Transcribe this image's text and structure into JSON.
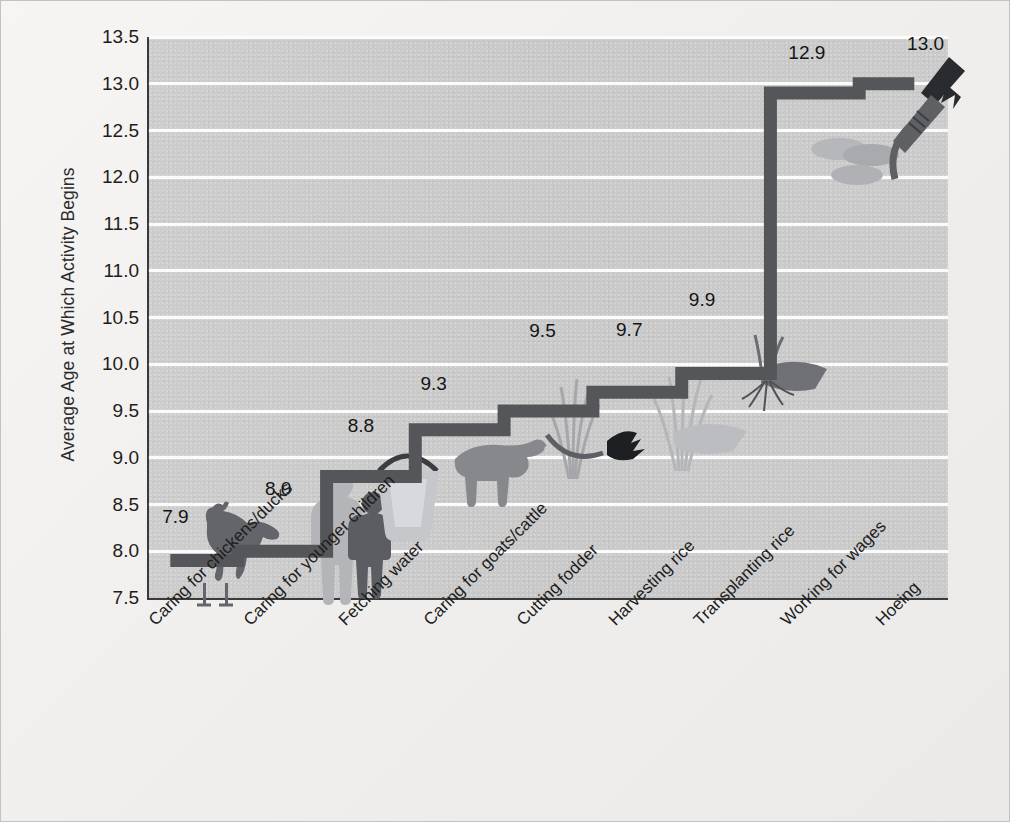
{
  "chart_data": {
    "type": "line",
    "title": "",
    "xlabel": "",
    "ylabel": "Average Age at Which Activity Begins",
    "categories": [
      "Caring for chickens/ducks",
      "Caring for younger children",
      "Fetching water",
      "Caring for goats/cattle",
      "Cutting fodder",
      "Harvesting  rice",
      "Transplanting rice",
      "Working for wages",
      "Hoeing"
    ],
    "values": [
      7.9,
      8.0,
      8.8,
      9.3,
      9.5,
      9.7,
      9.9,
      12.9,
      13.0
    ],
    "value_labels": [
      "7.9",
      "8.0",
      "8.8",
      "9.3",
      "9.5",
      "9.7",
      "9.9",
      "12.9",
      "13.0"
    ],
    "ylim": [
      7.5,
      13.5
    ],
    "ytick_labels": [
      "13.5",
      "13.0",
      "12.5",
      "12.0",
      "11.5",
      "11.0",
      "10.5",
      "10.0",
      "9.5",
      "9.0",
      "8.5",
      "8.0",
      "7.5"
    ],
    "ytick_values": [
      13.5,
      13.0,
      12.5,
      12.0,
      11.5,
      11.0,
      10.5,
      10.0,
      9.5,
      9.0,
      8.5,
      8.0,
      7.5
    ],
    "grid": true,
    "legend": "none",
    "style": "step-line with pictograms",
    "pictograms": [
      {
        "name": "chicken-pictogram",
        "category": "Caring for chickens/ducks"
      },
      {
        "name": "children-pictogram",
        "category": "Caring for younger children"
      },
      {
        "name": "water-bucket-pictogram",
        "category": "Fetching water"
      },
      {
        "name": "cattle-pictogram",
        "category": "Caring for goats/cattle"
      },
      {
        "name": "fodder-sickle-pictogram",
        "category": "Cutting fodder"
      },
      {
        "name": "rice-sheaf-pictogram",
        "category": "Harvesting  rice"
      },
      {
        "name": "rice-seedling-pictogram",
        "category": "Transplanting rice"
      },
      {
        "name": "coins-pictogram",
        "category": "Working for wages"
      },
      {
        "name": "hoe-pictogram",
        "category": "Hoeing"
      }
    ]
  },
  "colors": {
    "plot_background": "#cbcbcb",
    "figure_background": "#f1f0ee",
    "gridline": "#fbfbfb",
    "axis": "#3a3a3a",
    "line": "#55565a",
    "text": "#1d1d1d",
    "picto_dark": "#4f5155",
    "picto_light": "#a9aaad"
  }
}
